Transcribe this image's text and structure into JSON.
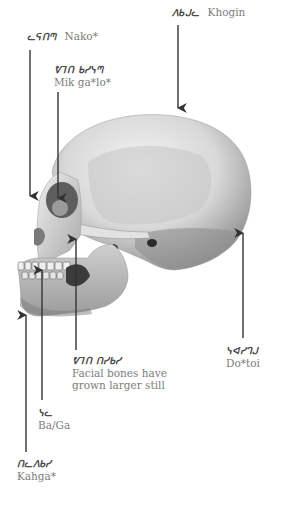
{
  "diagram": {
    "type": "anatomical-labeled-illustration",
    "colors": {
      "background": "#ffffff",
      "arrow": "#333333",
      "label_text": "#7a7a7a",
      "script_text": "#4a4a4a",
      "bone_light": "#e6e6e6",
      "bone_mid": "#bdbdbd",
      "bone_dark": "#6e6e6e"
    },
    "labels": [
      {
        "id": "khogin",
        "script": "ᐱᑲᒍᓚ",
        "roman": "Khogin",
        "layout": "inline",
        "x": 172,
        "y": 6,
        "arrow": {
          "x1": 178,
          "y1": 25,
          "x2": 178,
          "y2": 110,
          "dir": "down"
        }
      },
      {
        "id": "nako",
        "script": "ᓚᕋᑎᘉ",
        "roman": "Nako*",
        "layout": "inline",
        "x": 27,
        "y": 30,
        "arrow": {
          "x1": 30,
          "y1": 50,
          "x2": 30,
          "y2": 198,
          "dir": "down"
        }
      },
      {
        "id": "mik-galo",
        "script": "ᕓᒣᑎ ᑲᓯᓭᘉ",
        "roman": "Mik ga*lo*",
        "layout": "stacked",
        "x": 54,
        "y": 64,
        "arrow": {
          "x1": 58,
          "y1": 92,
          "x2": 58,
          "y2": 200,
          "dir": "down"
        }
      },
      {
        "id": "facial-bones",
        "script": "ᕓᒣᑎ ᑎᓯᑲᓯ",
        "roman": "Facial bones have grown larger still",
        "roman_lines": [
          "Facial bones have",
          "grown larger still"
        ],
        "layout": "stacked",
        "x": 72,
        "y": 355,
        "arrow": {
          "x1": 76,
          "y1": 350,
          "x2": 76,
          "y2": 237,
          "dir": "up"
        }
      },
      {
        "id": "dotoi",
        "script": "ᓭᐊᓯᒉᒍ",
        "roman": "Do*toi",
        "layout": "stacked",
        "x": 226,
        "y": 345,
        "arrow": {
          "x1": 243,
          "y1": 338,
          "x2": 243,
          "y2": 231,
          "dir": "up"
        }
      },
      {
        "id": "ba-ga",
        "script": "ᓭᓚ",
        "roman": "Ba/Ga",
        "layout": "stacked",
        "x": 38,
        "y": 407,
        "arrow": {
          "x1": 42,
          "y1": 400,
          "x2": 42,
          "y2": 268,
          "dir": "up"
        }
      },
      {
        "id": "kahga",
        "script": "ᑎᓚᐱᑲᓯ",
        "roman": "Kahga*",
        "layout": "stacked",
        "x": 17,
        "y": 458,
        "arrow": {
          "x1": 26,
          "y1": 452,
          "x2": 26,
          "y2": 313,
          "dir": "up"
        }
      }
    ]
  }
}
